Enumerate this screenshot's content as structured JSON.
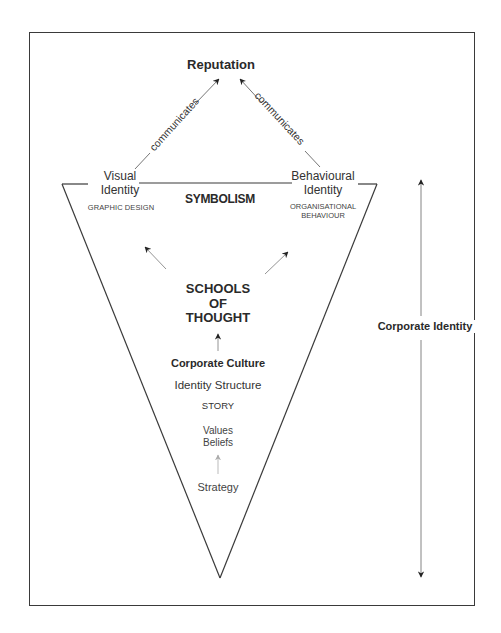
{
  "diagram": {
    "top_node": "Reputation",
    "edges": [
      {
        "from": "Visual Identity",
        "to": "Reputation",
        "label": "communicates"
      },
      {
        "from": "Behavioural Identity",
        "to": "Reputation",
        "label": "communicates"
      }
    ],
    "left_corner": {
      "title": "Visual Identity",
      "line1": "Visual",
      "line2": "Identity",
      "subtitle": "GRAPHIC DESIGN"
    },
    "right_corner": {
      "title": "Behavioural Identity",
      "line1": "Behavioural",
      "line2": "Identity",
      "subtitle_line1": "ORGANISATIONAL",
      "subtitle_line2": "BEHAVIOUR"
    },
    "top_band_label": "SYMBOLISM",
    "center": {
      "schools_line1": "SCHOOLS",
      "schools_line2": "OF",
      "schools_line3": "THOUGHT",
      "corporate_culture": "Corporate Culture",
      "identity_structure": "Identity Structure",
      "story": "STORY",
      "values": "Values",
      "beliefs": "Beliefs",
      "strategy": "Strategy"
    },
    "side_axis_label": "Corporate Identity",
    "colors": {
      "line": "#3a3a3a",
      "arrow_grey": "#9a9a9a",
      "text": "#2a2a2a",
      "background": "#ffffff"
    }
  }
}
